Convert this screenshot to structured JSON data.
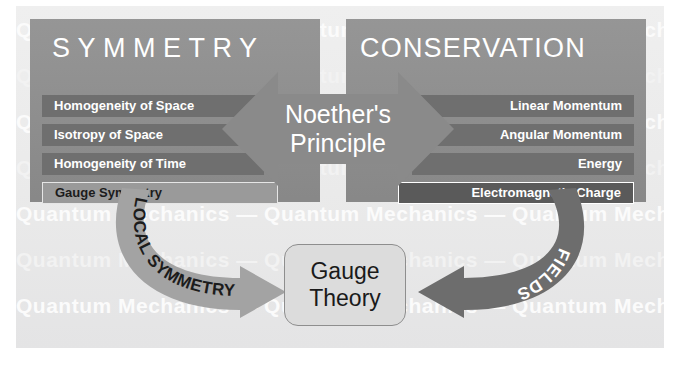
{
  "diagram": {
    "title_left": "SYMMETRY",
    "title_right": "CONSERVATION",
    "center_line1": "Noether's",
    "center_line2": "Principle",
    "bottom_line1": "Gauge",
    "bottom_line2": "Theory",
    "arrow_left_label": "LOCAL SYMMETRY",
    "arrow_right_label": "FIELDS"
  },
  "symmetry_items": [
    {
      "label": "Homogeneity of Space",
      "style": "plain"
    },
    {
      "label": "Isotropy of Space",
      "style": "plain"
    },
    {
      "label": "Homogeneity of Time",
      "style": "plain"
    },
    {
      "label": "Gauge Symmetry",
      "style": "highlight-light"
    }
  ],
  "conservation_items": [
    {
      "label": "Linear Momentum",
      "style": "plain"
    },
    {
      "label": "Angular Momentum",
      "style": "plain"
    },
    {
      "label": "Energy",
      "style": "plain"
    },
    {
      "label": "Electromagnetic Charge",
      "style": "highlight-dark"
    }
  ],
  "watermark": {
    "text": "Quantum  Mechanics  —  Quantum  Mechanics  —  Quantum  Mechanics",
    "rows": 6
  },
  "colors": {
    "page_background": "#ffffff",
    "plate_background": "#ebebec",
    "panel_fill": "#8f8f8f",
    "bar_fill": "#6f6f6f",
    "bar_highlight_light": "#9a9a9a",
    "bar_highlight_dark": "#5a5a5a",
    "center_arrow_fill": "#8a8a8a",
    "arrow_local_fill": "#a3a3a3",
    "arrow_fields_fill": "#6d6d6d",
    "gauge_box_fill": "#dcdcdc",
    "gauge_box_border": "#8e8e8e",
    "text_light": "#ffffff",
    "text_dark": "#1a1a1a",
    "watermark_text": "#fbfbfb"
  }
}
